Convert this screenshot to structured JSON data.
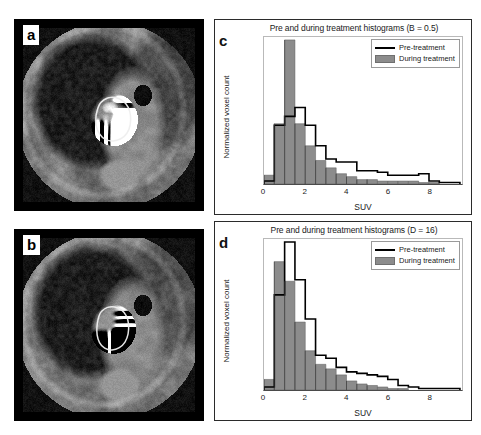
{
  "figure": {
    "panels": {
      "a": {
        "letter": "a",
        "description": "Pre-treatment PET/CT axial slice of lung tumour with delineated contour and heterogeneous bright uptake",
        "contour_color": "#e8e8e8"
      },
      "b": {
        "letter": "b",
        "description": "During-treatment PET/CT axial slice of lung tumour with delineated contour and homogeneous uptake",
        "contour_color": "#e8e8e8"
      },
      "c": {
        "letter": "c"
      },
      "d": {
        "letter": "d"
      }
    },
    "legend": {
      "pre_label": "Pre-treatment",
      "during_label": "During treatment",
      "pre_color": "#000000",
      "during_color": "#8c8c8c"
    },
    "axis": {
      "xlabel": "SUV",
      "ylabel": "Normalized voxel count"
    }
  },
  "chart_data": [
    {
      "id": "c",
      "type": "bar",
      "title": "Pre and during treatment histograms (B = 0.5)",
      "xlabel": "SUV",
      "ylabel": "Normalized voxel count",
      "xlim": [
        0,
        9.6
      ],
      "ylim": [
        0,
        1.0
      ],
      "xticks": [
        0,
        2,
        4,
        6,
        8
      ],
      "yticks": [],
      "grid": false,
      "legend_position": "top-right",
      "bin_width": 0.5,
      "bin_edges": [
        0,
        0.5,
        1.0,
        1.5,
        2.0,
        2.5,
        3.0,
        3.5,
        4.0,
        4.5,
        5.0,
        5.5,
        6.0,
        6.5,
        7.0,
        7.5,
        8.0,
        8.5,
        9.0,
        9.5
      ],
      "series": [
        {
          "name": "Pre-treatment",
          "style": "outline",
          "color": "#000000",
          "values": [
            0.02,
            0.4,
            0.46,
            0.52,
            0.4,
            0.26,
            0.17,
            0.15,
            0.15,
            0.09,
            0.09,
            0.08,
            0.06,
            0.06,
            0.06,
            0.07,
            0.02,
            0.01,
            0.01
          ]
        },
        {
          "name": "During treatment",
          "style": "filled",
          "color": "#8c8c8c",
          "values": [
            0.06,
            0.41,
            0.98,
            0.41,
            0.26,
            0.16,
            0.11,
            0.07,
            0.05,
            0.03,
            0.03,
            0.02,
            0.02,
            0.02,
            0.02,
            0.01,
            0.01,
            0.0,
            0.0
          ]
        }
      ]
    },
    {
      "id": "d",
      "type": "bar",
      "title": "Pre and during treatment histograms (D = 16)",
      "xlabel": "SUV",
      "ylabel": "Normalized voxel count",
      "xlim": [
        0,
        9.6
      ],
      "ylim": [
        0,
        1.0
      ],
      "xticks": [
        0,
        2,
        4,
        6,
        8
      ],
      "yticks": [],
      "grid": false,
      "legend_position": "top-right",
      "bin_width": 0.5,
      "bin_edges": [
        0,
        0.5,
        1.0,
        1.5,
        2.0,
        2.5,
        3.0,
        3.5,
        4.0,
        4.5,
        5.0,
        5.5,
        6.0,
        6.5,
        7.0,
        7.5,
        8.0,
        8.5,
        9.0,
        9.5
      ],
      "series": [
        {
          "name": "Pre-treatment",
          "style": "outline",
          "color": "#000000",
          "values": [
            0.02,
            0.63,
            0.98,
            0.73,
            0.47,
            0.23,
            0.21,
            0.15,
            0.12,
            0.11,
            0.1,
            0.09,
            0.07,
            0.03,
            0.02,
            0.01,
            0.01,
            0.01,
            0.01
          ]
        },
        {
          "name": "During treatment",
          "style": "filled",
          "color": "#8c8c8c",
          "values": [
            0.07,
            0.85,
            0.72,
            0.45,
            0.26,
            0.17,
            0.14,
            0.1,
            0.06,
            0.04,
            0.03,
            0.02,
            0.01,
            0.01,
            0.0,
            0.0,
            0.0,
            0.0,
            0.0
          ]
        }
      ]
    }
  ]
}
